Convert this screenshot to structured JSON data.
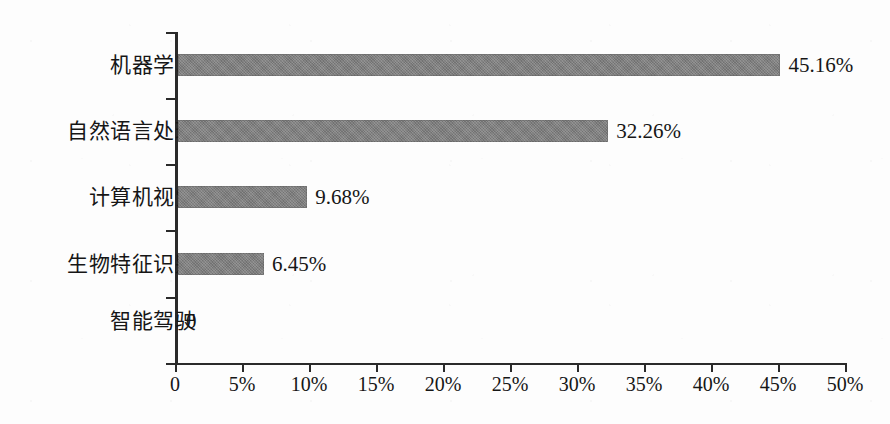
{
  "chart_data": {
    "type": "bar",
    "orientation": "horizontal",
    "title": "",
    "xlabel": "",
    "ylabel": "",
    "categories": [
      "机器学习",
      "自然语言处理",
      "计算机视觉",
      "生物特征识别",
      "智能驾驶"
    ],
    "values": [
      45.16,
      32.26,
      9.68,
      6.45,
      0
    ],
    "value_labels": [
      "45.16%",
      "32.26%",
      "9.68%",
      "6.45%",
      "0"
    ],
    "xlim": [
      0,
      50
    ],
    "xtick_values": [
      0,
      5,
      10,
      15,
      20,
      25,
      30,
      35,
      40,
      45,
      50
    ],
    "xtick_labels": [
      "0",
      "5%",
      "10%",
      "15%",
      "20%",
      "25%",
      "30%",
      "35%",
      "40%",
      "45%",
      "50%"
    ],
    "grid": false,
    "legend": false,
    "bar_color": "#7d7d7d",
    "axis_color": "#2a2a2a",
    "background_color": "#fdfdfd"
  },
  "axes": {
    "y_axis_name": "category-axis",
    "x_axis_name": "percentage-axis"
  }
}
